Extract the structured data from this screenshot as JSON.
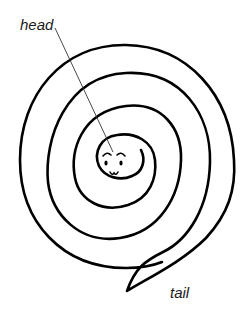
{
  "diagram": {
    "labels": {
      "head": "head",
      "tail": "tail"
    },
    "colors": {
      "stroke": "#000000",
      "leader_line": "#333333",
      "background": "#ffffff",
      "text": "#1a1a1a"
    },
    "elements": [
      {
        "name": "spiral-body",
        "type": "spiral",
        "turns": 4
      },
      {
        "name": "face",
        "type": "head",
        "features": [
          "eyebrows",
          "eyes",
          "nose"
        ]
      },
      {
        "name": "tail-point",
        "type": "pointed-tail"
      },
      {
        "name": "head-leader-line",
        "type": "leader-line",
        "connects": [
          "head-label",
          "face"
        ]
      }
    ]
  }
}
